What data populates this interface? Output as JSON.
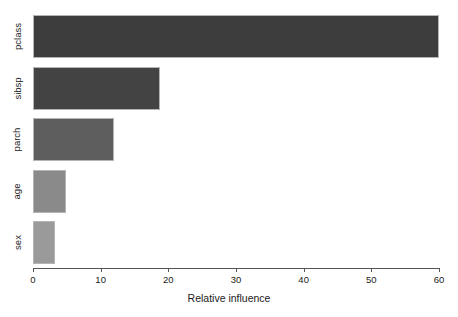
{
  "chart_data": {
    "type": "bar",
    "orientation": "horizontal",
    "title": "",
    "xlabel": "Relative influence",
    "ylabel": "",
    "categories": [
      "pclass",
      "sibsp",
      "parch",
      "age",
      "sex"
    ],
    "values": [
      60.0,
      18.7,
      11.9,
      4.9,
      3.3
    ],
    "bar_colors": [
      "#3d3d3d",
      "#434343",
      "#5e5e5e",
      "#8a8a8a",
      "#9a9a9a"
    ],
    "bar_border_color": "#b4b4b4",
    "xlim": [
      0,
      60
    ],
    "xticks": [
      0,
      10,
      20,
      30,
      40,
      50,
      60
    ],
    "xtick_labels": [
      "0",
      "10",
      "20",
      "30",
      "40",
      "50",
      "60"
    ],
    "grid": false,
    "legend": null,
    "background": "#ffffff",
    "axis_color": "#555555"
  }
}
